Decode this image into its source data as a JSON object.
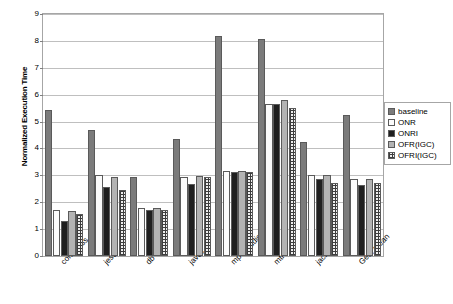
{
  "chart_data": {
    "type": "bar",
    "title": "",
    "xlabel": "",
    "ylabel": "Normalized Execution Time",
    "ylim": [
      0,
      9
    ],
    "ytick_step": 1,
    "yticks": [
      "0",
      "1",
      "2",
      "3",
      "4",
      "5",
      "6",
      "7",
      "8",
      "9"
    ],
    "grid": true,
    "legend_position": "right",
    "categories": [
      "compress",
      "jess",
      "db",
      "javac",
      "mpegaudio",
      "mtrt",
      "jack",
      "Geo. mean"
    ],
    "series": [
      {
        "name": "baseline",
        "pattern": "solid-dark-gray",
        "values": [
          5.43,
          4.7,
          2.93,
          4.35,
          8.18,
          8.08,
          4.25,
          5.25
        ]
      },
      {
        "name": "ONR",
        "pattern": "empty-white",
        "values": [
          1.7,
          3.03,
          1.77,
          2.93,
          3.17,
          5.65,
          3.0,
          2.85
        ]
      },
      {
        "name": "ONRI",
        "pattern": "dotted-black",
        "values": [
          1.3,
          2.58,
          1.72,
          2.67,
          3.12,
          5.65,
          2.85,
          2.63
        ]
      },
      {
        "name": "OFR(IGC)",
        "pattern": "solid-light-gray",
        "values": [
          1.67,
          2.93,
          1.8,
          2.98,
          3.17,
          5.82,
          3.0,
          2.85
        ]
      },
      {
        "name": "OFRI(IGC)",
        "pattern": "grid-crosshatch",
        "values": [
          1.58,
          2.47,
          1.72,
          2.93,
          3.12,
          5.5,
          2.73,
          2.73
        ]
      }
    ]
  },
  "legend": {
    "items": [
      {
        "label": "baseline"
      },
      {
        "label": "ONR"
      },
      {
        "label": "ONRI"
      },
      {
        "label": "OFR(IGC)"
      },
      {
        "label": "OFRI(IGC)"
      }
    ]
  },
  "colors": {
    "baseline": "#7b7b7b",
    "onr": "#fbfbfb",
    "onri": "#1f1f1f",
    "ofr": "#b3b3b3",
    "ofri": "#efefef",
    "grid": "#bfbfbf",
    "frame": "#a6a6a6"
  }
}
